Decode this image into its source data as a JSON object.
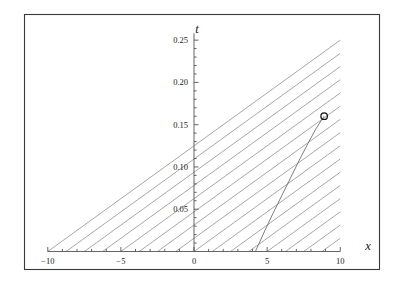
{
  "figure": {
    "background_color": "#ffffff",
    "frame_color": "#3a3a3a",
    "axis_color": "#4a4a4a",
    "line_color": "#8a8a8a",
    "curve_color": "#6e6e6e",
    "marker_color": "#111111",
    "frame": {
      "x": 24,
      "y": 14,
      "width": 356,
      "height": 256
    }
  },
  "axes": {
    "x_title": "x",
    "y_title": "t",
    "x_tick_labels": [
      "-10",
      "-5",
      "0",
      "5",
      "10"
    ],
    "x_tick_values": [
      -10,
      -5,
      0,
      5,
      10
    ],
    "y_tick_labels": [
      "0.05",
      "0.10",
      "0.15",
      "0.20",
      "0.25"
    ],
    "y_tick_values": [
      0.05,
      0.1,
      0.15,
      0.2,
      0.25
    ],
    "x_minor_count_per_interval": 5,
    "y_minor_count_per_interval": 5,
    "xlim": [
      -10.6,
      10.6
    ],
    "ylim": [
      0.0,
      0.262
    ],
    "grid": false
  },
  "chart_data": {
    "type": "line",
    "title": "",
    "subtitle": "",
    "xlabel": "x",
    "ylabel": "t",
    "xlim": [
      -10.6,
      10.6
    ],
    "ylim": [
      0.0,
      0.262
    ],
    "grid": false,
    "legend": null,
    "legend_position": "none",
    "description": "Family of straight characteristic lines in the (x,t) plane with a caustic/envelope curve converging to a marked breaking point.",
    "x_tick_values": [
      -10,
      -5,
      0,
      5,
      10
    ],
    "y_tick_values": [
      0.05,
      0.1,
      0.15,
      0.2,
      0.25
    ],
    "series": [
      {
        "name": "characteristics",
        "type": "line",
        "style": "solid",
        "color": "#8a8a8a",
        "width": 0.7,
        "description": "Straight lines of common slope dt/dx = 0.0125 (i.e. t = 0.0125*(x - x0)), drawn for evenly spaced foot points x0.",
        "slope_dt_dx": 0.0125,
        "x0_values": [
          -10.0,
          -8.75,
          -7.5,
          -6.25,
          -5.0,
          -3.75,
          -2.5,
          -1.25,
          0.0,
          1.25,
          2.5,
          3.75,
          5.0,
          6.25,
          7.5,
          8.75,
          10.0
        ],
        "t_at_x0": 0.0
      },
      {
        "name": "caustic-envelope",
        "type": "curve",
        "style": "solid",
        "color": "#6e6e6e",
        "width": 0.8,
        "description": "Envelope (caustic) of the characteristic family rising from the x-axis near x=4.2 and meeting the family tangentially at the marked point.",
        "x": [
          4.2,
          4.8,
          5.4,
          6.0,
          6.6,
          7.2,
          7.8,
          8.3,
          8.7,
          8.9
        ],
        "t": [
          0.0,
          0.023,
          0.045,
          0.066,
          0.087,
          0.108,
          0.128,
          0.144,
          0.155,
          0.16
        ]
      },
      {
        "name": "breaking-point-marker",
        "type": "scatter",
        "marker": "open-circle",
        "color": "#111111",
        "size": 6.5,
        "description": "Open circle marking the first breaking (gradient catastrophe) point.",
        "x": [
          8.9
        ],
        "t": [
          0.16
        ]
      }
    ]
  }
}
